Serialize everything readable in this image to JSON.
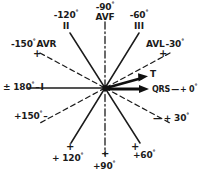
{
  "figure": {
    "center": {
      "x": 105,
      "y": 88
    },
    "colors": {
      "ink": "#1b1b1b",
      "background": "#ffffff"
    }
  },
  "axes": [
    {
      "name": "lead-I",
      "label_left": "± 180°",
      "roman": "I",
      "label_right": "+ 0°",
      "qrs_label": "QRS",
      "style": "solid",
      "angle_deg": 0
    },
    {
      "name": "lead-II",
      "label": "+ 120°",
      "opposite_label": "-120°",
      "roman": "II",
      "style": "solid",
      "angle_deg": 120
    },
    {
      "name": "lead-III",
      "label": "+ 60°",
      "opposite_label": "-60°",
      "roman": "III",
      "style": "solid",
      "angle_deg": 60
    },
    {
      "name": "avf",
      "label": "+ 90°",
      "opposite_label": "-90°",
      "lead": "AVF",
      "style": "dash-dot",
      "angle_deg": 90
    },
    {
      "name": "avr",
      "label": "+150°",
      "opposite_label": "-150°",
      "lead": "AVR",
      "style": "dashed",
      "angle_deg": 150
    },
    {
      "name": "avl",
      "label": "+ 30°",
      "opposite_label": "-30°",
      "lead": "AVL",
      "style": "dashed",
      "angle_deg": 30
    }
  ],
  "labels": {
    "neg90": "-90",
    "neg90_deg": "°",
    "avf": "AVF",
    "neg120": "-120",
    "neg120_deg": "°",
    "roman_II": "II",
    "neg60": "-60",
    "neg60_deg": "°",
    "roman_III": "III",
    "neg150": "-150",
    "neg150_deg": "°",
    "avr": "AVR",
    "avr_plus": "+",
    "avl": "AVL",
    "neg30": "-30",
    "neg30_deg": "°",
    "avl_plus": "+",
    "pm180": "± 180",
    "pm180_deg": "°",
    "pm180_dash": "–",
    "roman_I": "I",
    "t_vector": "T",
    "qrs_vector": "QRS",
    "qrs_dash": "—",
    "pos0": "+ 0",
    "pos0_deg": "°",
    "pos150": "+150",
    "pos150_deg": "°",
    "pos150_dash": "–",
    "pos30_dash": "—",
    "pos30": "+ 30",
    "pos30_deg": "°",
    "pos120_plus": "+",
    "pos120": "+ 120",
    "pos120_deg": "°",
    "pos90_plus": "+",
    "pos90": "+90",
    "pos90_deg": "°",
    "pos60_plus": "+",
    "pos60": "+60",
    "pos60_deg": "°"
  }
}
